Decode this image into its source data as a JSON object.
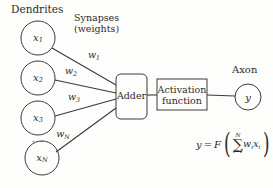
{
  "figure": {
    "background_color": "#fdfdfc",
    "stroke_color": "#3a3a3a",
    "text_color": "#2c2b2a"
  },
  "labels": {
    "dendrites": "Dendrites",
    "synapses_line1": "Synapses",
    "synapses_line2": "(weights)",
    "axon": "Axon",
    "ellipsis": "..."
  },
  "inputs": [
    {
      "id": "x1",
      "base": "x",
      "sub": "1",
      "cx": 38,
      "cy": 38,
      "r": 17
    },
    {
      "id": "x2",
      "base": "x",
      "sub": "2",
      "cx": 38,
      "cy": 78,
      "r": 17
    },
    {
      "id": "x3",
      "base": "x",
      "sub": "3",
      "cx": 38,
      "cy": 118,
      "r": 17
    },
    {
      "id": "xN",
      "base": "x",
      "sub": "N",
      "cx": 42,
      "cy": 158,
      "r": 17
    }
  ],
  "weights": [
    {
      "id": "w1",
      "base": "w",
      "sub": "1",
      "x": 94,
      "y": 55
    },
    {
      "id": "w2",
      "base": "w",
      "sub": "2",
      "x": 71,
      "y": 71
    },
    {
      "id": "w3",
      "base": "w",
      "sub": "3",
      "x": 74,
      "y": 97
    },
    {
      "id": "wN",
      "base": "w",
      "sub": "N",
      "x": 63,
      "y": 134
    }
  ],
  "blocks": {
    "adder": {
      "label": "Adder",
      "x": 116,
      "y": 74,
      "w": 31,
      "h": 45,
      "rx": 5
    },
    "activation": {
      "label_line1": "Activation",
      "label_line2": "function",
      "x": 157,
      "y": 79,
      "w": 50,
      "h": 31,
      "rx": 0
    }
  },
  "output": {
    "id": "y",
    "base": "y",
    "cx": 248,
    "cy": 97,
    "r": 13
  },
  "formula": {
    "lhs": "y",
    "equals": "=",
    "func": "F",
    "paren_open": "(",
    "paren_close": ")",
    "sum_symbol": "∑",
    "sum_upper": "N",
    "sum_lower": "i=1",
    "term_w": "w",
    "term_w_sub": "i",
    "term_x": "x",
    "term_x_sub": "i",
    "full_text": "y = F( sum_{i=1}^{N} w_i x_i )"
  }
}
